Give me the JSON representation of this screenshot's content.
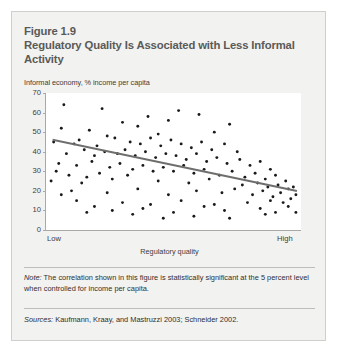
{
  "figure": {
    "number": "Figure 1.9",
    "title": "Regulatory Quality Is Associated with Less Informal Activity",
    "note_label": "Note:",
    "note_text": " The correlation shown in this figure is statistically significant at the 5 percent level when controlled for income per capita.",
    "sources_label": "Sources:",
    "sources_text": " Kaufmann, Kraay, and Mastruzzi 2003; Schneider 2002."
  },
  "colors": {
    "card_background": "#f2f2f1",
    "card_border": "#cfcfcd",
    "plot_background": "#ffffff",
    "axis": "#a9a9a7",
    "title_text": "#5a5a58",
    "body_text": "#2f2f2e",
    "point": "#1a1a1a",
    "trendline": "#6e6e6c"
  },
  "chart_data": {
    "type": "scatter",
    "title": "Regulatory Quality Is Associated with Less Informal Activity",
    "xlabel": "Regulatory quality",
    "ylabel": "Informal economy, % income per capita",
    "xlim": [
      0,
      100
    ],
    "ylim": [
      0,
      70
    ],
    "grid": false,
    "legend": null,
    "x_tick_labels": [
      "Low",
      "High"
    ],
    "y_ticks": [
      0,
      10,
      20,
      30,
      40,
      50,
      60,
      70
    ],
    "trendline": {
      "type": "linear-fit",
      "x_start": 3,
      "y_start": 46,
      "x_end": 98,
      "y_end": 20
    },
    "points": [
      [
        7,
        64
      ],
      [
        22,
        62
      ],
      [
        52,
        61
      ],
      [
        40,
        58
      ],
      [
        6,
        52
      ],
      [
        17,
        51
      ],
      [
        30,
        55
      ],
      [
        36,
        53
      ],
      [
        48,
        56
      ],
      [
        60,
        59
      ],
      [
        66,
        50
      ],
      [
        72,
        54
      ],
      [
        44,
        49
      ],
      [
        27,
        47
      ],
      [
        13,
        46
      ],
      [
        3,
        45
      ],
      [
        11,
        44
      ],
      [
        20,
        43
      ],
      [
        24,
        48
      ],
      [
        33,
        45
      ],
      [
        37,
        44
      ],
      [
        41,
        47
      ],
      [
        45,
        43
      ],
      [
        49,
        46
      ],
      [
        53,
        44
      ],
      [
        57,
        42
      ],
      [
        61,
        45
      ],
      [
        65,
        41
      ],
      [
        70,
        44
      ],
      [
        75,
        40
      ],
      [
        8,
        39
      ],
      [
        15,
        41
      ],
      [
        19,
        38
      ],
      [
        23,
        40
      ],
      [
        28,
        39
      ],
      [
        31,
        41
      ],
      [
        35,
        38
      ],
      [
        39,
        40
      ],
      [
        43,
        37
      ],
      [
        47,
        39
      ],
      [
        51,
        38
      ],
      [
        55,
        36
      ],
      [
        59,
        39
      ],
      [
        63,
        35
      ],
      [
        67,
        37
      ],
      [
        71,
        34
      ],
      [
        76,
        36
      ],
      [
        80,
        33
      ],
      [
        84,
        35
      ],
      [
        88,
        31
      ],
      [
        5,
        34
      ],
      [
        12,
        33
      ],
      [
        18,
        35
      ],
      [
        25,
        32
      ],
      [
        29,
        34
      ],
      [
        34,
        31
      ],
      [
        38,
        33
      ],
      [
        42,
        30
      ],
      [
        46,
        32
      ],
      [
        50,
        30
      ],
      [
        54,
        33
      ],
      [
        58,
        29
      ],
      [
        62,
        31
      ],
      [
        68,
        28
      ],
      [
        73,
        30
      ],
      [
        78,
        27
      ],
      [
        82,
        29
      ],
      [
        86,
        26
      ],
      [
        90,
        28
      ],
      [
        94,
        25
      ],
      [
        9,
        28
      ],
      [
        16,
        27
      ],
      [
        21,
        29
      ],
      [
        26,
        26
      ],
      [
        32,
        28
      ],
      [
        2,
        25
      ],
      [
        14,
        24
      ],
      [
        44,
        25
      ],
      [
        56,
        24
      ],
      [
        64,
        26
      ],
      [
        77,
        23
      ],
      [
        83,
        24
      ],
      [
        87,
        22
      ],
      [
        91,
        23
      ],
      [
        95,
        21
      ],
      [
        10,
        20
      ],
      [
        24,
        19
      ],
      [
        36,
        21
      ],
      [
        48,
        18
      ],
      [
        59,
        20
      ],
      [
        69,
        19
      ],
      [
        74,
        21
      ],
      [
        81,
        18
      ],
      [
        85,
        20
      ],
      [
        89,
        17
      ],
      [
        92,
        19
      ],
      [
        96,
        16
      ],
      [
        97,
        22
      ],
      [
        93,
        14
      ],
      [
        88,
        15
      ],
      [
        79,
        14
      ],
      [
        66,
        13
      ],
      [
        53,
        15
      ],
      [
        41,
        13
      ],
      [
        30,
        14
      ],
      [
        19,
        12
      ],
      [
        12,
        15
      ],
      [
        6,
        18
      ],
      [
        26,
        10
      ],
      [
        38,
        11
      ],
      [
        50,
        9
      ],
      [
        62,
        12
      ],
      [
        70,
        10
      ],
      [
        84,
        11
      ],
      [
        90,
        9
      ],
      [
        95,
        12
      ],
      [
        98,
        18
      ],
      [
        86,
        8
      ],
      [
        58,
        7
      ],
      [
        34,
        8
      ],
      [
        16,
        9
      ],
      [
        46,
        6
      ],
      [
        72,
        6
      ],
      [
        98,
        9
      ],
      [
        4,
        30
      ]
    ]
  }
}
